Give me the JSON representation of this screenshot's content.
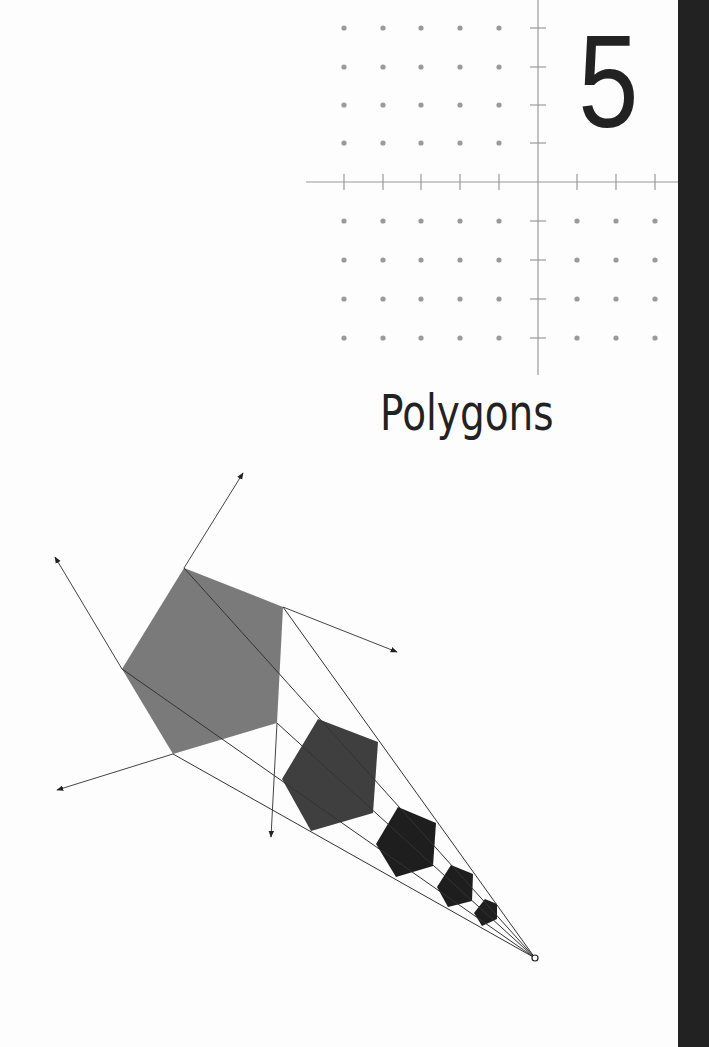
{
  "chapter": {
    "number": "5",
    "title": "Polygons"
  },
  "colors": {
    "ink": "#222222",
    "grid": "#9a9a9a",
    "thumb_bar": "#222222",
    "polygon_fills": [
      "#7a7a7a",
      "#3f3f3f",
      "#1e1e1e",
      "#1e1e1e",
      "#1e1e1e"
    ]
  },
  "icons": {
    "coordinate_grid": "coordinate-grid-icon",
    "dilation_diagram": "polygon-dilation-icon"
  }
}
